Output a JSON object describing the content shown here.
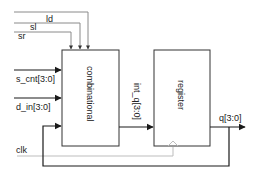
{
  "diagram": {
    "type": "block-diagram",
    "blocks": [
      {
        "id": "combinational",
        "label": "combinational"
      },
      {
        "id": "register",
        "label": "register"
      }
    ],
    "inputs": {
      "ld": "ld",
      "sl": "sl",
      "sr": "sr",
      "s_cnt": "s_cnt[3:0]",
      "d_in": "d_in[3:0]",
      "clk": "clk"
    },
    "internal_signal": "int_q[3:0]",
    "output": "q[3:0]",
    "colors": {
      "wire": "#1a1a1a",
      "control_wire": "#8a8a8a",
      "clock_wire": "#bdbdbd",
      "block_border": "#333333"
    }
  }
}
